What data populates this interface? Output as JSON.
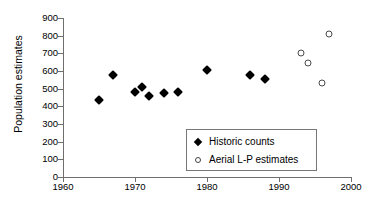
{
  "chart_data": {
    "type": "scatter",
    "title": "",
    "xlabel": "",
    "ylabel": "Population estimates",
    "xlim": [
      1960,
      2000
    ],
    "ylim": [
      0,
      900
    ],
    "xticks": [
      "1960",
      "1970",
      "1980",
      "1990",
      "2000"
    ],
    "yticks": [
      "0",
      "100",
      "200",
      "300",
      "400",
      "500",
      "600",
      "700",
      "800",
      "900"
    ],
    "grid": false,
    "legend_position": "inside-lower-right",
    "series": [
      {
        "name": "Historic counts",
        "marker": "filled-diamond",
        "color": "#000000",
        "points": [
          {
            "x": 1965,
            "y": 437
          },
          {
            "x": 1967,
            "y": 578
          },
          {
            "x": 1970,
            "y": 479
          },
          {
            "x": 1971,
            "y": 510
          },
          {
            "x": 1972,
            "y": 460
          },
          {
            "x": 1974,
            "y": 475
          },
          {
            "x": 1976,
            "y": 481
          },
          {
            "x": 1980,
            "y": 608
          },
          {
            "x": 1986,
            "y": 580
          },
          {
            "x": 1988,
            "y": 552
          }
        ]
      },
      {
        "name": "Aerial L-P estimates",
        "marker": "open-circle",
        "color": "#4a4a4a",
        "points": [
          {
            "x": 1993,
            "y": 700
          },
          {
            "x": 1994,
            "y": 645
          },
          {
            "x": 1996,
            "y": 530
          },
          {
            "x": 1997,
            "y": 812
          }
        ]
      }
    ]
  },
  "legend": {
    "items": [
      {
        "label": "Historic counts",
        "marker": "filled-diamond"
      },
      {
        "label": "Aerial L-P estimates",
        "marker": "open-circle"
      }
    ]
  }
}
